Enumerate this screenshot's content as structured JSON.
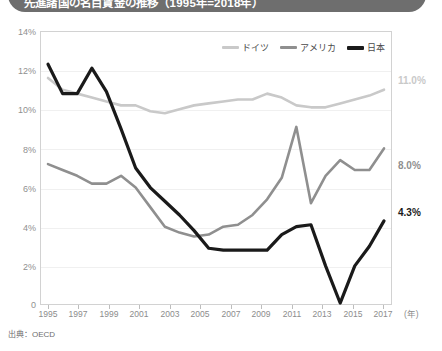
{
  "title": "先進諸国の名目賃金の推移（1995年=2018年）",
  "source_note": "出典：OECD",
  "axis": {
    "y_ticks": [
      "0",
      "2%",
      "4%",
      "6%",
      "8%",
      "10%",
      "12%",
      "14%"
    ],
    "x_ticks": [
      "1995",
      "1997",
      "1999",
      "2001",
      "2003",
      "2005",
      "2007",
      "2009",
      "2011",
      "2013",
      "2015",
      "2017"
    ],
    "x_unit": "(年)"
  },
  "legend": {
    "items": [
      {
        "label": "ドイツ",
        "color": "#c9c9c9"
      },
      {
        "label": "アメリカ",
        "color": "#8f8f8f"
      },
      {
        "label": "日本",
        "color": "#1a1a1a"
      }
    ]
  },
  "end_labels": [
    {
      "value": "11.0%",
      "color": "#c9c9c9",
      "top": 76
    },
    {
      "value": "8.0%",
      "color": "#8f8f8f",
      "top": 161
    },
    {
      "value": "4.3%",
      "color": "#1a1a1a",
      "top": 208
    }
  ],
  "chart_data": {
    "type": "line",
    "title": "先進諸国の名目賃金の推移（1995年=2018年）",
    "xlabel": "(年)",
    "ylabel": "",
    "ylim": [
      0,
      14
    ],
    "xlim": [
      1995,
      2018
    ],
    "grid": true,
    "legend_position": "top-right",
    "x": [
      1995,
      1996,
      1997,
      1998,
      1999,
      2000,
      2001,
      2002,
      2003,
      2004,
      2005,
      2006,
      2007,
      2008,
      2009,
      2010,
      2011,
      2012,
      2013,
      2014,
      2015,
      2016,
      2017,
      2018
    ],
    "series": [
      {
        "name": "ドイツ",
        "color": "#c9c9c9",
        "values": [
          11.6,
          11.0,
          10.8,
          10.6,
          10.4,
          10.2,
          10.2,
          9.9,
          9.8,
          10.0,
          10.2,
          10.3,
          10.4,
          10.5,
          10.5,
          10.8,
          10.6,
          10.2,
          10.1,
          10.1,
          10.3,
          10.5,
          10.7,
          11.0
        ]
      },
      {
        "name": "アメリカ",
        "color": "#8f8f8f",
        "values": [
          7.2,
          6.9,
          6.6,
          6.2,
          6.2,
          6.6,
          6.0,
          5.0,
          4.0,
          3.7,
          3.5,
          3.6,
          4.0,
          4.1,
          4.6,
          5.4,
          6.5,
          9.1,
          5.2,
          6.6,
          7.4,
          6.9,
          6.9,
          8.0
        ]
      },
      {
        "name": "日本",
        "color": "#1a1a1a",
        "values": [
          12.3,
          10.8,
          10.8,
          12.1,
          10.9,
          9.0,
          7.0,
          6.0,
          5.3,
          4.6,
          3.8,
          2.9,
          2.8,
          2.8,
          2.8,
          2.8,
          3.6,
          4.0,
          4.1,
          2.0,
          0.1,
          2.0,
          3.0,
          4.3
        ]
      }
    ]
  }
}
